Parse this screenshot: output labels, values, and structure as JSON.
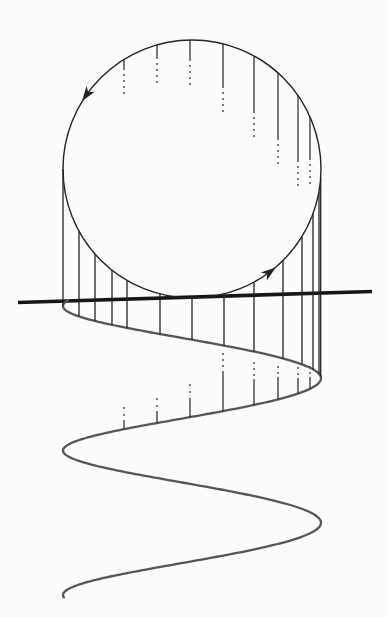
{
  "figure": {
    "canvas": {
      "width": 388,
      "height": 617,
      "background": "#fcfcfa"
    },
    "colors": {
      "ink": "#222222",
      "axis": "#161616",
      "helix": "#565656",
      "dot": "#3c3c3c"
    },
    "circle": {
      "cx": 192,
      "cy": 169,
      "r": 129,
      "stroke_width": 1.4
    },
    "axis": {
      "x1": 18,
      "y1": 302.5,
      "x2": 372,
      "y2": 291.5,
      "stroke_width": 3.6
    },
    "helix": {
      "cx": 192,
      "rx": 129,
      "y0": 306,
      "pitch_per_rad": 23.0,
      "wobble": 2.4,
      "theta_start": -0.28,
      "theta_end": 12.69,
      "stroke_width": 2.3
    },
    "rotation_arrows": [
      {
        "phi_deg": 215.0,
        "length": 15,
        "half_width": 5
      },
      {
        "phi_deg": 52.9,
        "length": 15,
        "half_width": 5
      }
    ],
    "front_lines": {
      "stroke_width": 1.3,
      "x_positions": [
        63,
        79,
        95,
        112,
        127,
        160,
        192,
        224,
        254,
        283,
        302,
        313,
        319,
        320.7
      ]
    },
    "back_lines": {
      "stroke_width": 1.2,
      "dot_radius": 0.9,
      "lines": [
        {
          "x": 124,
          "top_solid_end": 70,
          "top_dots": [
            75,
            81,
            87,
            93
          ],
          "bottom_dots": [
            408,
            415
          ],
          "bottom_solid_start": 420
        },
        {
          "x": 157,
          "top_solid_end": 59,
          "top_dots": [
            64,
            70,
            76,
            82
          ],
          "bottom_dots": [
            399,
            406
          ],
          "bottom_solid_start": 411
        },
        {
          "x": 190,
          "top_solid_end": 61,
          "top_dots": [
            66,
            72,
            78,
            84
          ],
          "bottom_dots": [
            385,
            392
          ],
          "bottom_solid_start": 398
        },
        {
          "x": 223,
          "top_solid_end": 88,
          "top_dots": [
            93,
            99,
            105,
            111
          ],
          "bottom_dots": [
            354,
            360,
            366
          ],
          "bottom_solid_start": 371
        },
        {
          "x": 254,
          "top_solid_end": 113,
          "top_dots": [
            118,
            124,
            130,
            136
          ],
          "bottom_dots": [
            363,
            369,
            375
          ],
          "bottom_solid_start": 379
        },
        {
          "x": 278,
          "top_solid_end": 140,
          "top_dots": [
            145,
            151,
            157,
            163
          ],
          "bottom_dots": [
            367,
            373
          ],
          "bottom_solid_start": 377
        },
        {
          "x": 298,
          "top_solid_end": 162,
          "top_dots": [
            167,
            173,
            179,
            185
          ],
          "bottom_dots": [
            368,
            374
          ],
          "bottom_solid_start": 378
        },
        {
          "x": 310,
          "top_solid_end": 160,
          "top_dots": [
            165,
            171,
            177,
            183
          ],
          "bottom_dots": [
            367,
            373
          ],
          "bottom_solid_start": 377
        }
      ]
    }
  }
}
